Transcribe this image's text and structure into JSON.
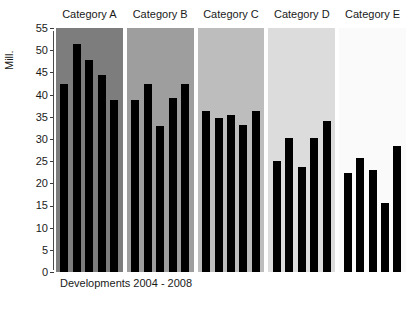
{
  "chart_data": {
    "type": "bar",
    "title": "",
    "subtitle": "",
    "caption": "Developments 2004 - 2008",
    "xlabel": "",
    "ylabel": "Mill.",
    "ylim": [
      0,
      55
    ],
    "ytick_step": 5,
    "yticks": [
      55,
      50,
      45,
      40,
      35,
      30,
      25,
      20,
      15,
      10,
      5,
      0
    ],
    "grid": false,
    "legend": "none",
    "bar_color": "#000000",
    "categories": [
      "2004",
      "2005",
      "2006",
      "2007",
      "2008"
    ],
    "panels": [
      {
        "label": "Category A",
        "background": "#7d7d7d",
        "values": [
          42.4,
          51.3,
          47.8,
          44.4,
          38.8
        ]
      },
      {
        "label": "Category B",
        "background": "#9e9e9e",
        "values": [
          38.8,
          42.4,
          32.9,
          39.2,
          42.4
        ]
      },
      {
        "label": "Category C",
        "background": "#bdbdbd",
        "values": [
          36.3,
          34.7,
          35.5,
          33.2,
          36.4
        ]
      },
      {
        "label": "Category D",
        "background": "#dcdcdc",
        "values": [
          25.0,
          30.1,
          23.7,
          30.1,
          34.1
        ]
      },
      {
        "label": "Category E",
        "background": "#fafafa",
        "values": [
          22.4,
          25.8,
          23.0,
          15.6,
          28.4
        ]
      }
    ]
  }
}
